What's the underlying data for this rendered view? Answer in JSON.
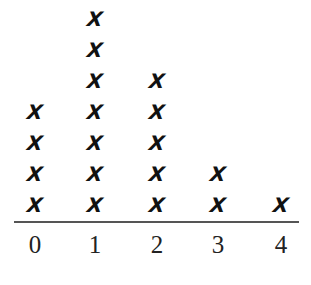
{
  "chart_data": {
    "type": "dot-plot",
    "title": "",
    "xlabel": "",
    "ylabel": "",
    "categories": [
      "0",
      "1",
      "2",
      "3",
      "4"
    ],
    "values": [
      4,
      7,
      5,
      2,
      1
    ],
    "marker": "X",
    "xlim": [
      0,
      4
    ],
    "grid": false,
    "legend": null
  },
  "layout": {
    "col_centers": [
      35,
      95,
      157,
      218,
      281
    ],
    "row_spacing": 31,
    "base_y": 205
  }
}
